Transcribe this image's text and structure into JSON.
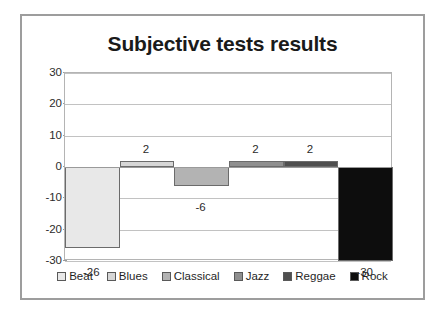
{
  "chart_data": {
    "type": "bar",
    "title": "Subjective tests results",
    "xlabel": "",
    "ylabel": "",
    "categories": [
      "Beat",
      "Blues",
      "Classical",
      "Jazz",
      "Reggae",
      "Rock"
    ],
    "values": [
      -26,
      2,
      -6,
      2,
      2,
      -30
    ],
    "data_labels": [
      "-26",
      "2",
      "-6",
      "2",
      "2",
      "-30"
    ],
    "ylim": [
      -30,
      30
    ],
    "yticks": [
      30,
      20,
      10,
      0,
      -10,
      -20,
      -30
    ],
    "ytick_labels": [
      "30",
      "20",
      "10",
      "0",
      "-10",
      "-20",
      "-30"
    ],
    "grid": true,
    "legend": true,
    "legend_position": "bottom",
    "series_colors": [
      "#e8e8e8",
      "#d6d6d6",
      "#b3b3b3",
      "#8f8f8f",
      "#4f4f4f",
      "#0d0d0d"
    ],
    "legend_entries": [
      {
        "label": "Beat",
        "color": "#e8e8e8"
      },
      {
        "label": "Blues",
        "color": "#d6d6d6"
      },
      {
        "label": "Classical",
        "color": "#b3b3b3"
      },
      {
        "label": "Jazz",
        "color": "#8f8f8f"
      },
      {
        "label": "Reggae",
        "color": "#4f4f4f"
      },
      {
        "label": "Rock",
        "color": "#0d0d0d"
      }
    ]
  }
}
